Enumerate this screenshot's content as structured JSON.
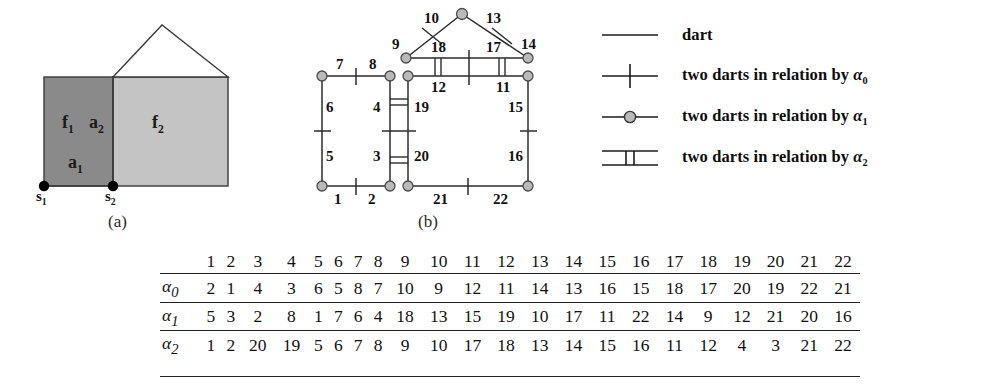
{
  "figures": [
    {
      "id": "fig-a",
      "caption": "(a)",
      "labels": [
        {
          "name": "face-label-f1",
          "text": "f",
          "sub": "1"
        },
        {
          "name": "edge-label-a2",
          "text": "a",
          "sub": "2"
        },
        {
          "name": "face-label-f2",
          "text": "f",
          "sub": "2"
        },
        {
          "name": "edge-label-a1",
          "text": "a",
          "sub": "1"
        },
        {
          "name": "vertex-label-s1",
          "text": "s",
          "sub": "1"
        },
        {
          "name": "vertex-label-s2",
          "text": "s",
          "sub": "2"
        }
      ],
      "colors": {
        "face_f1_fill": "#8a8a8a",
        "face_f2_fill": "#c0c0c0",
        "outline": "#3a3a3a",
        "vertex_dot": "#000000"
      }
    },
    {
      "id": "fig-b",
      "caption": "(b)",
      "dart_labels": [
        "1",
        "2",
        "3",
        "4",
        "5",
        "6",
        "7",
        "8",
        "9",
        "10",
        "11",
        "12",
        "13",
        "14",
        "15",
        "16",
        "17",
        "18",
        "19",
        "20",
        "21",
        "22"
      ],
      "colors": {
        "node_fill": "#b9b9b9",
        "node_stroke": "#4a4a4a",
        "edge": "#2b2b2b"
      }
    }
  ],
  "legend": {
    "items": [
      {
        "key": "line",
        "label": "dart",
        "sub": ""
      },
      {
        "key": "line-with-tick",
        "label": "two darts in relation by ",
        "greek": "α",
        "sub": "0"
      },
      {
        "key": "line-with-circle",
        "label": "two darts in relation by ",
        "greek": "α",
        "sub": "1"
      },
      {
        "key": "double-bar",
        "label": "two darts in relation by ",
        "greek": "α",
        "sub": "2"
      }
    ]
  },
  "table": {
    "corner": "",
    "header": [
      "1",
      "2",
      "3",
      "4",
      "5",
      "6",
      "7",
      "8",
      "9",
      "10",
      "11",
      "12",
      "13",
      "14",
      "15",
      "16",
      "17",
      "18",
      "19",
      "20",
      "21",
      "22"
    ],
    "rows": [
      {
        "name": "alpha-0",
        "greek": "α",
        "sub": "0",
        "values": [
          "2",
          "1",
          "4",
          "3",
          "6",
          "5",
          "8",
          "7",
          "10",
          "9",
          "12",
          "11",
          "14",
          "13",
          "16",
          "15",
          "18",
          "17",
          "20",
          "19",
          "22",
          "21"
        ]
      },
      {
        "name": "alpha-1",
        "greek": "α",
        "sub": "1",
        "values": [
          "5",
          "3",
          "2",
          "8",
          "1",
          "7",
          "6",
          "4",
          "18",
          "13",
          "15",
          "19",
          "10",
          "17",
          "11",
          "22",
          "14",
          "9",
          "12",
          "21",
          "20",
          "16"
        ]
      },
      {
        "name": "alpha-2",
        "greek": "α",
        "sub": "2",
        "values": [
          "1",
          "2",
          "20",
          "19",
          "5",
          "6",
          "7",
          "8",
          "9",
          "10",
          "17",
          "18",
          "13",
          "14",
          "15",
          "16",
          "11",
          "12",
          "4",
          "3",
          "21",
          "22"
        ]
      }
    ]
  }
}
